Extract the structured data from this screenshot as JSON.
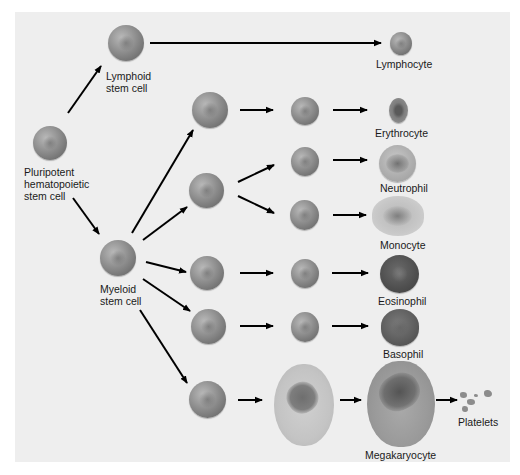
{
  "diagram": {
    "title": "",
    "type": "hematopoiesis lineage tree",
    "background_color": "#eeeeee",
    "arrow_color": "#000000"
  },
  "nodes": {
    "pluripotent": {
      "label": "Pluripotent\nhematopoietic\nstem cell"
    },
    "lymphoid": {
      "label": "Lymphoid\nstem cell"
    },
    "myeloid": {
      "label": "Myeloid\nstem cell"
    },
    "lymphocyte": {
      "label": "Lymphocyte"
    },
    "erythrocyte": {
      "label": "Erythrocyte"
    },
    "neutrophil": {
      "label": "Neutrophil"
    },
    "monocyte": {
      "label": "Monocyte"
    },
    "eosinophil": {
      "label": "Eosinophil"
    },
    "basophil": {
      "label": "Basophil"
    },
    "megakaryocyte": {
      "label": "Megakaryocyte"
    },
    "platelets": {
      "label": "Platelets"
    }
  },
  "edges": [
    [
      "pluripotent",
      "lymphoid"
    ],
    [
      "pluripotent",
      "myeloid"
    ],
    [
      "lymphoid",
      "lymphocyte"
    ],
    [
      "myeloid",
      "erythroid-progenitor"
    ],
    [
      "erythroid-progenitor",
      "erythroid-precursor"
    ],
    [
      "erythroid-precursor",
      "erythrocyte"
    ],
    [
      "myeloid",
      "granulocyte-monocyte-progenitor"
    ],
    [
      "granulocyte-monocyte-progenitor",
      "neutrophil-precursor"
    ],
    [
      "granulocyte-monocyte-progenitor",
      "monocyte-precursor"
    ],
    [
      "neutrophil-precursor",
      "neutrophil"
    ],
    [
      "monocyte-precursor",
      "monocyte"
    ],
    [
      "myeloid",
      "eosinophil-progenitor"
    ],
    [
      "eosinophil-progenitor",
      "eosinophil-precursor"
    ],
    [
      "eosinophil-precursor",
      "eosinophil"
    ],
    [
      "myeloid",
      "basophil-progenitor"
    ],
    [
      "basophil-progenitor",
      "basophil-precursor"
    ],
    [
      "basophil-precursor",
      "basophil"
    ],
    [
      "myeloid",
      "megakaryocyte-progenitor"
    ],
    [
      "megakaryocyte-progenitor",
      "megakaryoblast"
    ],
    [
      "megakaryoblast",
      "megakaryocyte"
    ],
    [
      "megakaryocyte",
      "platelets"
    ]
  ]
}
